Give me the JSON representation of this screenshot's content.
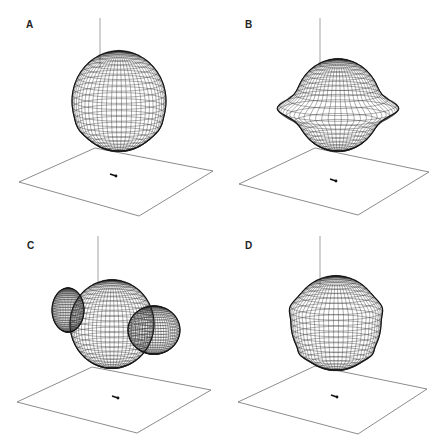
{
  "figure": {
    "panels": [
      {
        "id": "A",
        "label": "A",
        "shape": "oblate-sphere",
        "offset": [
          0,
          0
        ],
        "label_pos": [
          26,
          25
        ],
        "axis_top": [
          100,
          18
        ],
        "axis_bottom": [
          100,
          68
        ],
        "plane": [
          [
            19,
            182
          ],
          [
            95,
            148
          ],
          [
            213,
            171
          ],
          [
            139,
            216
          ]
        ],
        "center": [
          119,
          101
        ],
        "rx": 47,
        "ry": 50,
        "bulge": 0,
        "marker": [
          113,
          175
        ]
      },
      {
        "id": "B",
        "label": "B",
        "shape": "sphere-with-equatorial-ring",
        "offset": [
          223,
          0
        ],
        "label_pos": [
          22,
          25
        ],
        "axis_top": [
          97,
          18
        ],
        "axis_bottom": [
          97,
          66
        ],
        "plane": [
          [
            16,
            184
          ],
          [
            92,
            148
          ],
          [
            206,
            172
          ],
          [
            135,
            215
          ]
        ],
        "center": [
          115,
          105
        ],
        "rx": 43,
        "ry": 46,
        "bulge": 18,
        "marker": [
          110,
          180
        ]
      },
      {
        "id": "C",
        "label": "C",
        "shape": "multi-lobed",
        "offset": [
          0,
          224
        ],
        "label_pos": [
          27,
          22
        ],
        "axis_top": [
          98,
          12
        ],
        "axis_bottom": [
          98,
          60
        ],
        "plane": [
          [
            17,
            178
          ],
          [
            92,
            143
          ],
          [
            211,
            166
          ],
          [
            137,
            209
          ]
        ],
        "center": [
          112,
          100
        ],
        "rx": 42,
        "ry": 44,
        "bulge": 0,
        "marker": [
          115,
          173
        ]
      },
      {
        "id": "D",
        "label": "D",
        "shape": "sphere-with-band",
        "offset": [
          223,
          224
        ],
        "label_pos": [
          22,
          22
        ],
        "axis_top": [
          97,
          12
        ],
        "axis_bottom": [
          97,
          62
        ],
        "plane": [
          [
            15,
            178
          ],
          [
            92,
            142
          ],
          [
            204,
            165
          ],
          [
            135,
            210
          ]
        ],
        "center": [
          113,
          99
        ],
        "rx": 45,
        "ry": 47,
        "bulge": 4,
        "marker": [
          111,
          172
        ]
      }
    ],
    "colors": {
      "mesh": "#2a2a2a",
      "plane": "#6f6f6f",
      "axis": "#8a8a8a",
      "label": "#222222"
    }
  }
}
